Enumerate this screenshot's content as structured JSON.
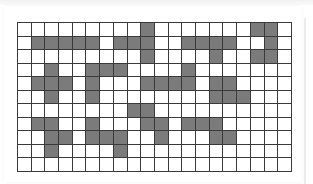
{
  "puzzle": {
    "columns": 20,
    "rows": 11,
    "colors": {
      "filled": "#7b7b7b",
      "empty": "#ffffff",
      "gridline": "#3a3a3a"
    },
    "filled_cells_by_row": [
      [
        9,
        17,
        18
      ],
      [
        1,
        2,
        3,
        4,
        5,
        7,
        8,
        9,
        12,
        13,
        14,
        15,
        18
      ],
      [
        9,
        14,
        17,
        18
      ],
      [
        2,
        5,
        6,
        7,
        12
      ],
      [
        1,
        2,
        3,
        5,
        9,
        10,
        11,
        12,
        14,
        15
      ],
      [
        2,
        5,
        14,
        15,
        16
      ],
      [
        8,
        9
      ],
      [
        1,
        2,
        5,
        9,
        10,
        12,
        13,
        14
      ],
      [
        2,
        3,
        5,
        6,
        7,
        10,
        14,
        15
      ],
      [
        2,
        7
      ],
      []
    ]
  }
}
